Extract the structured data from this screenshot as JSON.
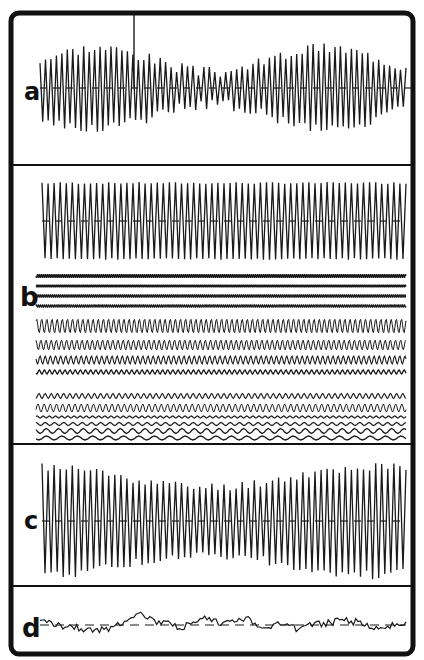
{
  "figure": {
    "background": "#ffffff",
    "ink": "#111111",
    "frame": {
      "x": 11,
      "y": 13,
      "width": 402,
      "height": 641,
      "radius": 8
    },
    "dividers_y": [
      165,
      444,
      586
    ]
  },
  "panels": [
    {
      "id": "a",
      "label": "a",
      "label_pos": [
        24,
        100
      ],
      "trace": {
        "x0": 40,
        "x1": 406,
        "center": 88,
        "cycles": 67,
        "amp": 28,
        "amp_var": 12,
        "seed": 3,
        "stroke": 1.3,
        "spike_x": 134
      },
      "baseline": {
        "y": 88,
        "style": "dash-segments"
      }
    },
    {
      "id": "b",
      "label": "b",
      "label_pos": [
        20,
        306
      ],
      "main_trace": {
        "x0": 42,
        "x1": 406,
        "center": 221,
        "cycles": 60,
        "amp": 38,
        "amp_var": 2,
        "seed": 7,
        "stroke": 1.3
      },
      "sub_traces": [
        {
          "y": 276,
          "amp": 1.6,
          "cycles": 190,
          "stroke": 1.2
        },
        {
          "y": 286,
          "amp": 0.8,
          "cycles": 190,
          "stroke": 1.6
        },
        {
          "y": 296,
          "amp": 1.4,
          "cycles": 190,
          "stroke": 1.2
        },
        {
          "y": 306,
          "amp": 1.2,
          "cycles": 190,
          "stroke": 1.2
        },
        {
          "y": 326,
          "amp": 7,
          "cycles": 72,
          "stroke": 1.0
        },
        {
          "y": 345,
          "amp": 5,
          "cycles": 72,
          "stroke": 1.0
        },
        {
          "y": 360,
          "amp": 4,
          "cycles": 72,
          "stroke": 1.1
        },
        {
          "y": 372,
          "amp": 2,
          "cycles": 72,
          "stroke": 1.3
        },
        {
          "y": 396,
          "amp": 2.5,
          "cycles": 60,
          "stroke": 1.1
        },
        {
          "y": 408,
          "amp": 4,
          "cycles": 60,
          "stroke": 1.0
        },
        {
          "y": 417,
          "amp": 1,
          "cycles": 60,
          "stroke": 1.2
        },
        {
          "y": 424,
          "amp": 1.5,
          "cycles": 40,
          "stroke": 1.2
        },
        {
          "y": 431,
          "amp": 2.5,
          "cycles": 30,
          "stroke": 1.3
        },
        {
          "y": 438,
          "amp": 2,
          "cycles": 24,
          "stroke": 1.3
        }
      ],
      "sub_x0": 36,
      "sub_x1": 406
    },
    {
      "id": "c",
      "label": "c",
      "label_pos": [
        24,
        529
      ],
      "trace": {
        "x0": 42,
        "x1": 406,
        "center": 521,
        "cycles": 60,
        "amp": 44,
        "amp_var": 10,
        "seed": 11,
        "stroke": 1.3
      },
      "baseline": {
        "y": 521,
        "style": "dash-segments"
      }
    },
    {
      "id": "d",
      "label": "d",
      "label_pos": [
        22,
        637
      ],
      "trace": {
        "x0": 40,
        "x1": 406,
        "center": 625,
        "points": 160,
        "amp": 12,
        "seed": 21,
        "stroke": 1.2
      },
      "baseline": {
        "y": 625,
        "style": "dashed"
      }
    }
  ]
}
